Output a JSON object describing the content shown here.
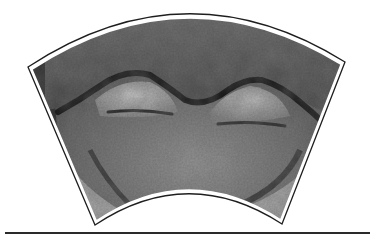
{
  "figure": {
    "style": "grayscale photograph",
    "frame_color": "#1e1e1e",
    "stone_dark": "#3a3a3a",
    "stone_mid": "#6e6e6e",
    "stone_light": "#b4b4b4"
  },
  "divider": {
    "color": "#2a2a2a"
  }
}
